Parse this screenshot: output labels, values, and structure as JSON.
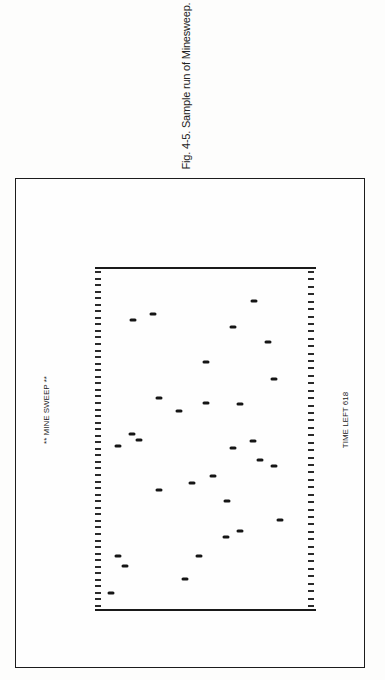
{
  "caption": "Fig. 4-5. Sample run of Minesweep.",
  "screen": {
    "title": "** MINE SWEEP **",
    "time_left_label": "TIME LEFT 618",
    "time_left": 618,
    "tick_count_left": 52,
    "tick_count_right": 46,
    "field_origin": [
      95,
      267
    ],
    "mines": [
      [
        111,
        593
      ],
      [
        118,
        556
      ],
      [
        125,
        566
      ],
      [
        185,
        579
      ],
      [
        199,
        556
      ],
      [
        226,
        537
      ],
      [
        240,
        531
      ],
      [
        280,
        520
      ],
      [
        227,
        501
      ],
      [
        159,
        490
      ],
      [
        192,
        483
      ],
      [
        213,
        476
      ],
      [
        274,
        466
      ],
      [
        260,
        460
      ],
      [
        118,
        446
      ],
      [
        233,
        448
      ],
      [
        253,
        441
      ],
      [
        139,
        440
      ],
      [
        132,
        434
      ],
      [
        179,
        411
      ],
      [
        159,
        398
      ],
      [
        206,
        403
      ],
      [
        240,
        404
      ],
      [
        274,
        379
      ],
      [
        206,
        362
      ],
      [
        268,
        342
      ],
      [
        233,
        327
      ],
      [
        133,
        320
      ],
      [
        153,
        314
      ],
      [
        254,
        301
      ]
    ]
  }
}
